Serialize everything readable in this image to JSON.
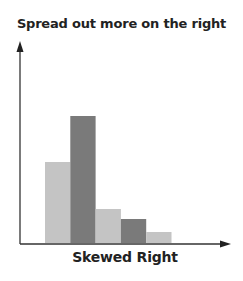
{
  "chart_data": {
    "type": "bar",
    "title": "Spread out more on the right",
    "xlabel": "Skewed Right",
    "ylabel": "",
    "categories": [
      "1",
      "2",
      "3",
      "4",
      "5"
    ],
    "values": [
      81,
      127,
      34,
      24,
      11
    ],
    "bar_colors": [
      "#c4c4c4",
      "#7a7a7a",
      "#c4c4c4",
      "#7a7a7a",
      "#c4c4c4"
    ],
    "ylim": [
      0,
      200
    ],
    "grid": false,
    "legend": "none",
    "axes": {
      "x_arrow": true,
      "y_arrow": true,
      "ticks": false
    }
  }
}
